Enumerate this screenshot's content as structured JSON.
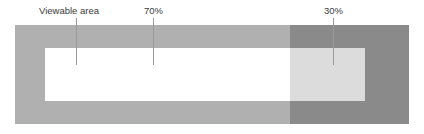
{
  "diagram": {
    "colors": {
      "page_background": "#ffffff",
      "band": "#b0b0b0",
      "band_overlay_right": "#8a8a8a",
      "viewable_rect": "#ffffff",
      "viewable_rect_shaded": "#dcdcdc",
      "leader_line": "#9a9a9a",
      "label_text": "#3b3b3b"
    },
    "callouts": [
      {
        "id": "viewable-area",
        "label": "Viewable area",
        "points_to": "white-inner-rectangle"
      },
      {
        "id": "seventy-percent",
        "label": "70%",
        "points_to": "light-band-segment"
      },
      {
        "id": "thirty-percent",
        "label": "30%",
        "points_to": "dark-band-segment"
      }
    ]
  },
  "chart_data": {
    "type": "bar",
    "categories": [
      "70%",
      "30%"
    ],
    "values": [
      70,
      30
    ],
    "series": [
      {
        "name": "Proportion of width",
        "values": [
          70,
          30
        ]
      }
    ],
    "annotations": [
      "Viewable area",
      "70%",
      "30%"
    ],
    "xlabel": "",
    "ylabel": "",
    "ylim": [
      0,
      100
    ],
    "grid": false,
    "legend": "none",
    "orientation": "horizontal"
  }
}
